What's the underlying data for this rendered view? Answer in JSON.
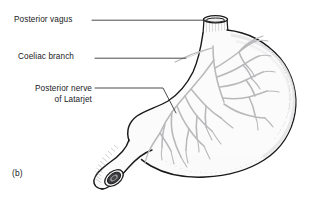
{
  "figure": {
    "caption": "(b)",
    "background_color": "#ffffff",
    "outline_color": "#1a1a1a",
    "organ_fill_color": "#fbfbfb",
    "nerve_color": "#b9b9bc",
    "leader_color": "#2b2b2b",
    "text_color": "#19191c"
  },
  "labels": {
    "posterior_vagus": "Posterior vagus",
    "coeliac_branch": "Coeliac branch",
    "latarjet_line1": "Posterior nerve",
    "latarjet_line2": "of Latarjet"
  },
  "structures": {
    "esophagus": "esophagus-stump",
    "fundus": "gastric-fundus",
    "body": "gastric-body",
    "antrum": "gastric-antrum",
    "pylorus": "pylorus",
    "duodenum": "duodenal-stump",
    "greater_curvature": "greater-curvature",
    "lesser_curvature": "lesser-curvature"
  }
}
